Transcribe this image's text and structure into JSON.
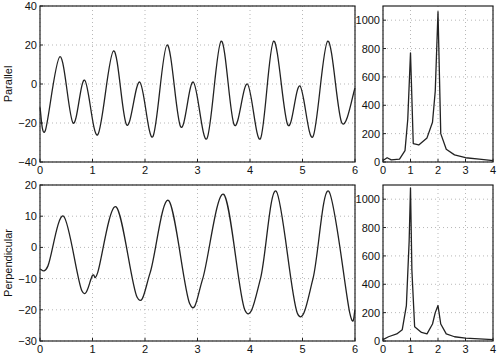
{
  "chart_data": [
    {
      "id": "parallel-time",
      "type": "line",
      "ylabel": "Parallel",
      "xlabel": "",
      "xlim": [
        0,
        6
      ],
      "ylim": [
        -40,
        40
      ],
      "xticks": [
        "0",
        "1",
        "2",
        "3",
        "4",
        "5",
        "6"
      ],
      "yticks": [
        "-40",
        "-20",
        "0",
        "20",
        "40"
      ],
      "grid": true,
      "x": [
        0,
        0.1,
        0.38,
        0.63,
        0.85,
        1.1,
        1.4,
        1.65,
        1.9,
        2.15,
        2.42,
        2.68,
        2.92,
        3.18,
        3.45,
        3.7,
        3.95,
        4.2,
        4.45,
        4.72,
        4.95,
        5.2,
        5.48,
        5.75,
        6.0
      ],
      "values": [
        -12,
        -24,
        14,
        -20,
        2,
        -26,
        17,
        -21,
        1,
        -27,
        20,
        -22,
        1,
        -28,
        22,
        -21,
        0,
        -28,
        22,
        -21,
        -1,
        -27,
        22,
        -20,
        -2
      ]
    },
    {
      "id": "parallel-spectrum",
      "type": "line",
      "xlabel": "",
      "xlim": [
        0,
        4
      ],
      "ylim": [
        0,
        1100
      ],
      "xticks": [
        "0",
        "1",
        "2",
        "3",
        "4"
      ],
      "yticks": [
        "0",
        "200",
        "400",
        "600",
        "800",
        "1000"
      ],
      "grid": true,
      "x": [
        0,
        0.15,
        0.3,
        0.6,
        0.8,
        0.9,
        1.0,
        1.1,
        1.3,
        1.6,
        1.8,
        1.9,
        2.0,
        2.1,
        2.3,
        2.6,
        3.0,
        3.5,
        4.0
      ],
      "values": [
        10,
        30,
        15,
        20,
        80,
        300,
        770,
        130,
        120,
        170,
        280,
        500,
        1060,
        200,
        90,
        50,
        30,
        20,
        10
      ]
    },
    {
      "id": "perpendicular-time",
      "type": "line",
      "ylabel": "Perpendicular",
      "xlabel": "",
      "xlim": [
        0,
        6
      ],
      "ylim": [
        -30,
        20
      ],
      "xticks": [
        "0",
        "1",
        "2",
        "3",
        "4",
        "5",
        "6"
      ],
      "yticks": [
        "-30",
        "-20",
        "-10",
        "0",
        "10",
        "20"
      ],
      "grid": true,
      "x": [
        0,
        0.15,
        0.45,
        0.8,
        1.0,
        1.1,
        1.45,
        1.85,
        2.1,
        2.45,
        2.85,
        3.1,
        3.5,
        3.9,
        4.2,
        4.5,
        4.9,
        5.2,
        5.5,
        5.9,
        6.0
      ],
      "values": [
        -7,
        -6,
        10,
        -14,
        -9,
        -8,
        13,
        -16,
        -8,
        15,
        -18,
        -10,
        17,
        -20,
        -10,
        18,
        -21,
        -10,
        18,
        -21,
        -20
      ]
    },
    {
      "id": "perpendicular-spectrum",
      "type": "line",
      "xlabel": "",
      "xlim": [
        0,
        4
      ],
      "ylim": [
        0,
        1100
      ],
      "xticks": [
        "0",
        "1",
        "2",
        "3",
        "4"
      ],
      "yticks": [
        "0",
        "200",
        "400",
        "600",
        "800",
        "1000"
      ],
      "grid": true,
      "x": [
        0,
        0.2,
        0.5,
        0.7,
        0.85,
        0.95,
        1.0,
        1.05,
        1.15,
        1.4,
        1.6,
        1.8,
        1.9,
        2.0,
        2.1,
        2.3,
        2.6,
        3.0,
        4.0
      ],
      "values": [
        10,
        30,
        50,
        80,
        250,
        700,
        1080,
        500,
        100,
        60,
        50,
        120,
        200,
        250,
        120,
        50,
        30,
        20,
        10
      ]
    }
  ]
}
